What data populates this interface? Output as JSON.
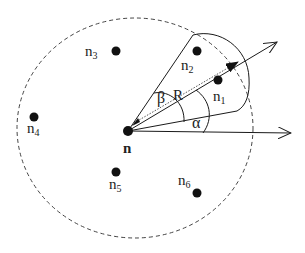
{
  "diagram": {
    "center_node": {
      "label": "n",
      "x": 128,
      "y": 131
    },
    "neighbors": [
      {
        "label": "n",
        "sub": "1",
        "x": 218,
        "y": 80,
        "lx": 213,
        "ly": 101
      },
      {
        "label": "n",
        "sub": "2",
        "x": 197,
        "y": 51,
        "lx": 181,
        "ly": 70
      },
      {
        "label": "n",
        "sub": "3",
        "x": 116,
        "y": 51,
        "lx": 85,
        "ly": 56
      },
      {
        "label": "n",
        "sub": "4",
        "x": 34,
        "y": 117,
        "lx": 27,
        "ly": 133
      },
      {
        "label": "n",
        "sub": "5",
        "x": 116,
        "y": 172,
        "lx": 109,
        "ly": 189
      },
      {
        "label": "n",
        "sub": "6",
        "x": 197,
        "y": 193,
        "lx": 178,
        "ly": 185
      }
    ],
    "angle_labels": {
      "alpha": "α",
      "beta": "β",
      "radius": "R"
    },
    "range_circle": {
      "cx": 135,
      "cy": 128,
      "rx": 118,
      "ry": 110,
      "style": "dashed"
    },
    "colors": {
      "ink": "#1a1a1a",
      "dashed": "#444444",
      "dotted": "#555555"
    }
  }
}
